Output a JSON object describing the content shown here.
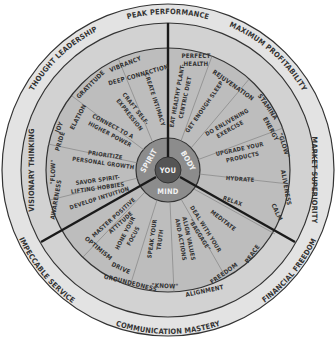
{
  "center": {
    "label": "YOU"
  },
  "core": [
    {
      "label": "SPIRIT"
    },
    {
      "label": "BODY"
    },
    {
      "label": "MIND"
    }
  ],
  "outer_ring": [
    {
      "label": "PEAK PERFORMANCE"
    },
    {
      "label": "MAXIMUM PROFITABILITY"
    },
    {
      "label": "MARKET SUPERIORITY"
    },
    {
      "label": "FINANCIAL FREEDOM"
    },
    {
      "label": "COMMUNICATION MASTERY"
    },
    {
      "label": "IMPECCABLE SERVICE"
    },
    {
      "label": "VISIONARY THINKING"
    },
    {
      "label": "THOUGHT LEADERSHIP"
    }
  ],
  "middle_ring": {
    "spirit": [
      "AWARENESS",
      "\"FLOW\"",
      "PRIDE",
      "JOY",
      "ELATION",
      "GRATITUDE",
      "VIBRANCY",
      "DEEP CONNECTION"
    ],
    "body": [
      "PERFECT HEALTH",
      "REJUVENATION",
      "STAMINA",
      "ENERGY",
      "\"GLOW\"",
      "ALIVENESS",
      "CALM"
    ],
    "mind": [
      "PEACE",
      "FREEDOM",
      "ALIGNMENT",
      "\"KNOW\"",
      "GROUNDEDNESS",
      "DRIVE",
      "OPTIMISM"
    ]
  },
  "inner_ring": {
    "spirit": [
      "DEVELOP INTUITION",
      "SAVOR SPIRIT-LIFTING HOBBIES",
      "PRIORITIZE PERSONAL GROWTH",
      "CONNECT TO A HIGHER POWER",
      "CRAFT SELF-EXPRESSION",
      "CREATE INTIMACY"
    ],
    "body": [
      "EAT HEALTHY PLANT-CENTRIC DIET",
      "GET ENOUGH SLEEP",
      "DO ENLIVENING EXERCISE",
      "UPGRADE YOUR PRODUCTS",
      "HYDRATE",
      "RELAX"
    ],
    "mind": [
      "MEDITATE",
      "DEAL WITH YOUR \"BAGGAGE\"",
      "ALIGN VALUES AND ACTIONS",
      "SPEAK YOUR TRUTH",
      "HONE YOUR FOCUS",
      "MASTER POSITIVE ATTITUDE"
    ]
  },
  "colors": {
    "outer_ring": "#e3e3e3",
    "middle_ring": "#cfcfcf",
    "inner_ring": "#b9b9b9",
    "core_ring": "#8a8a8a",
    "center": "#555555",
    "lines": "#222222",
    "text": "#333333"
  }
}
